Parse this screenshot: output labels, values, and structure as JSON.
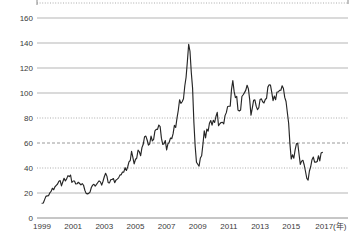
{
  "chart_data": {
    "type": "line",
    "title": "",
    "x_axis": {
      "tick_labels": [
        "1999",
        "2001",
        "2003",
        "2005",
        "2007",
        "2009",
        "2011",
        "2013",
        "2015",
        "2017"
      ],
      "unit_suffix": "(年)",
      "start_year": 1999,
      "end_year": 2017,
      "frequency": "monthly"
    },
    "y_axis": {
      "tick_labels": [
        "0",
        "20",
        "40",
        "60",
        "80",
        "100",
        "120",
        "140",
        "160"
      ],
      "ticks": [
        0,
        20,
        40,
        60,
        80,
        100,
        120,
        140,
        160
      ],
      "range": [
        0,
        172
      ]
    },
    "grid": {
      "styles_by_value": {
        "0": "axis",
        "20": "solid",
        "40": "dotted",
        "60": "dashed",
        "80": "dotted",
        "100": "solid",
        "120": "solid",
        "140": "solid",
        "160": "solid"
      },
      "top_border_style": "dotted",
      "legend": "none"
    },
    "series": [
      {
        "name": "price",
        "start": "1999-01",
        "values": [
          11.8,
          12.0,
          14.7,
          17.3,
          17.7,
          17.9,
          20.1,
          21.3,
          23.8,
          22.6,
          25.0,
          26.1,
          27.2,
          29.4,
          29.9,
          25.7,
          28.8,
          31.8,
          29.7,
          31.3,
          33.9,
          33.1,
          34.4,
          28.4,
          29.6,
          29.6,
          27.2,
          27.4,
          28.6,
          27.6,
          26.5,
          27.5,
          26.2,
          22.2,
          19.7,
          19.3,
          19.7,
          20.7,
          24.4,
          26.3,
          27.0,
          25.5,
          26.9,
          28.4,
          29.7,
          28.9,
          26.3,
          29.4,
          33.0,
          35.8,
          33.5,
          28.2,
          28.1,
          30.7,
          30.8,
          31.6,
          28.3,
          30.3,
          31.1,
          32.1,
          34.3,
          34.7,
          36.8,
          36.7,
          40.3,
          38.0,
          40.8,
          44.9,
          46.0,
          53.3,
          48.5,
          43.3,
          46.8,
          48.0,
          54.3,
          53.0,
          49.8,
          56.3,
          59.0,
          65.0,
          65.5,
          62.4,
          58.3,
          59.4,
          65.5,
          61.6,
          62.9,
          69.7,
          70.9,
          70.9,
          74.4,
          73.1,
          63.9,
          58.9,
          59.4,
          62.0,
          54.5,
          59.3,
          60.6,
          64.0,
          63.5,
          67.5,
          74.1,
          72.4,
          79.9,
          86.2,
          94.6,
          91.7,
          93.0,
          95.4,
          105.6,
          112.6,
          125.4,
          139.0,
          133.4,
          116.6,
          103.9,
          76.7,
          57.4,
          44.6,
          43.0,
          41.5,
          48.0,
          49.8,
          59.2,
          69.7,
          64.1,
          71.1,
          69.5,
          75.8,
          78.0,
          74.3,
          78.2,
          76.4,
          81.2,
          84.5,
          73.8,
          75.4,
          76.4,
          76.6,
          75.3,
          81.9,
          84.3,
          89.2,
          89.4,
          89.5,
          102.9,
          110.0,
          101.3,
          96.3,
          97.3,
          86.3,
          85.6,
          86.4,
          97.2,
          98.6,
          100.3,
          102.3,
          106.2,
          103.3,
          94.7,
          82.3,
          87.9,
          94.1,
          94.5,
          89.5,
          86.7,
          88.2,
          94.8,
          95.3,
          93.0,
          92.0,
          94.8,
          95.8,
          104.7,
          106.6,
          106.3,
          100.5,
          93.9,
          97.6,
          94.6,
          100.8,
          100.8,
          102.1,
          102.2,
          105.8,
          103.6,
          96.5,
          93.2,
          84.4,
          75.8,
          59.3,
          47.2,
          50.6,
          47.8,
          54.5,
          59.3,
          59.8,
          51.2,
          42.9,
          45.5,
          46.2,
          42.4,
          37.2,
          31.7,
          30.3,
          37.6,
          41.0,
          46.7,
          48.8,
          44.7,
          44.7,
          45.2,
          49.8,
          45.7,
          52.0,
          52.5
        ]
      }
    ],
    "colors": {
      "line": "#262626",
      "grid_solid": "#b5b5b5",
      "grid_dotted": "#ababab",
      "grid_dashed": "#9a9a9a",
      "axis": "#8e8e8e",
      "frame_tick": "#888888",
      "label": "#3a3a3a",
      "background": "#ffffff"
    }
  }
}
